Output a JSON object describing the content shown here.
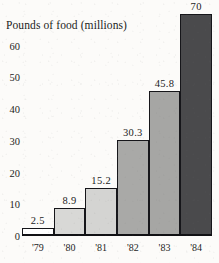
{
  "chart_data": {
    "type": "bar",
    "title": "Pounds of food (millions)",
    "xlabel": "",
    "ylabel": "",
    "categories": [
      "'79",
      "'80",
      "'81",
      "'82",
      "'83",
      "'84"
    ],
    "values": [
      2.5,
      8.9,
      15.2,
      30.3,
      45.8,
      70
    ],
    "value_labels": [
      "2.5",
      "8.9",
      "15.2",
      "30.3",
      "45.8",
      "70"
    ],
    "ylim": [
      0,
      70
    ],
    "y_ticks": [
      0,
      10,
      20,
      30,
      40,
      50,
      60
    ],
    "y_tick_labels": [
      "0",
      "10",
      "20",
      "30",
      "40",
      "50",
      "60"
    ],
    "grid": false,
    "legend": false,
    "bar_colors": [
      "#ffffff",
      "#d8d8d6",
      "#d4d4d2",
      "#a9a9a7",
      "#a6a6a4",
      "#4a4a4c"
    ],
    "bar_border_color": "#16161a",
    "axis_color": "#111114",
    "text_color": "#1c1c1c"
  },
  "axis": {
    "y_labels": [
      "60",
      "50",
      "40",
      "30",
      "20",
      "10",
      "0"
    ],
    "x_labels": [
      "'79",
      "'80",
      "'81",
      "'82",
      "'83",
      "'84"
    ]
  }
}
